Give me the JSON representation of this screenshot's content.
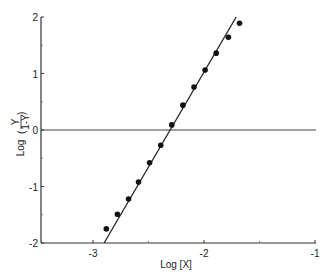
{
  "chart_data": {
    "type": "scatter",
    "title": "",
    "xlabel": "Log [X]",
    "ylabel": "Log (Y / (1-Y))",
    "ylabel_parts": {
      "prefix": "Log",
      "numerator": "Y",
      "denominator": "1-Y"
    },
    "xlim": [
      -3.5,
      -1
    ],
    "ylim": [
      -2,
      2
    ],
    "xticks": [
      -3,
      -2,
      -1
    ],
    "xtick_labels": [
      "-3",
      "-2",
      "-1"
    ],
    "xminor_ticks": [
      -2.5,
      -1.5
    ],
    "yticks": [
      -2,
      -1,
      0,
      1,
      2
    ],
    "ytick_labels": [
      "-2",
      "-1",
      "0",
      "1",
      "2"
    ],
    "yminor_ticks": [
      -1.5,
      -0.5,
      0.5,
      1.5
    ],
    "grid": false,
    "reference_line": {
      "y": 0
    },
    "series": [
      {
        "name": "data",
        "marker": "filled-circle",
        "x": [
          -2.88,
          -2.78,
          -2.68,
          -2.59,
          -2.49,
          -2.39,
          -2.29,
          -2.19,
          -2.09,
          -1.99,
          -1.89,
          -1.78,
          -1.68
        ],
        "y": [
          -1.75,
          -1.49,
          -1.22,
          -0.92,
          -0.58,
          -0.27,
          0.09,
          0.44,
          0.76,
          1.06,
          1.36,
          1.64,
          1.89
        ]
      }
    ],
    "fit_line": {
      "x": [
        -2.9,
        -1.71
      ],
      "y": [
        -2,
        2
      ]
    }
  }
}
